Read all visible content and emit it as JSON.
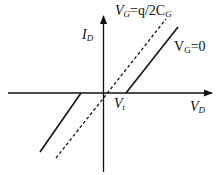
{
  "diagram": {
    "type": "IV-characteristic",
    "colors": {
      "line": "#111111",
      "background": "#ffffff"
    },
    "axes": {
      "y_label": {
        "main": "I",
        "sub": "D"
      },
      "x_label": {
        "main": "V",
        "sub": "D"
      },
      "origin_label": {
        "main": "V",
        "sub": "t"
      }
    },
    "curves": [
      {
        "name": "VG=0",
        "style": "solid",
        "label": {
          "main": "V",
          "sub": "G",
          "rest": "=0"
        }
      },
      {
        "name": "VG=q/2CG",
        "style": "dashed",
        "label": {
          "main": "V",
          "sub": "G",
          "mid": "=q/2C",
          "sub2": "G"
        }
      }
    ]
  }
}
